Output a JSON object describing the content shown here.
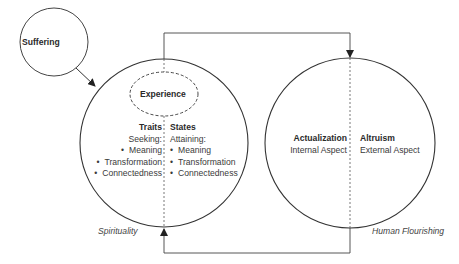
{
  "nodes": {
    "suffering": {
      "label": "Suffering"
    },
    "experience": {
      "label": "Experience"
    },
    "spirituality": {
      "label": "Spirituality",
      "traits": {
        "title": "Traits",
        "subtitle": "Seeking:",
        "items": [
          "Meaning",
          "Transformation",
          "Connectedness"
        ]
      },
      "states": {
        "title": "States",
        "subtitle": "Attaining:",
        "items": [
          "Meaning",
          "Transformation",
          "Connectedness"
        ]
      }
    },
    "human_flourishing": {
      "label": "Human Flourishing",
      "actualization": {
        "title": "Actualization",
        "subtitle": "Internal Aspect"
      },
      "altruism": {
        "title": "Altruism",
        "subtitle": "External Aspect"
      }
    }
  },
  "edges": [
    {
      "from": "Suffering",
      "to": "Spirituality"
    },
    {
      "from": "Spirituality",
      "to": "Human Flourishing",
      "route": "top"
    },
    {
      "from": "Human Flourishing",
      "to": "Spirituality",
      "route": "bottom"
    }
  ],
  "colors": {
    "stroke": "#333333",
    "text": "#333333",
    "background": "#ffffff"
  }
}
